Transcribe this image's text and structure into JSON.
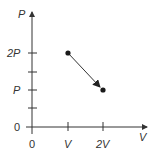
{
  "diagram": {
    "type": "pv-diagram",
    "axes": {
      "y_label": "P",
      "x_label": "V",
      "origin_label_y": "0",
      "origin_label_x": "0"
    },
    "y_ticks": [
      {
        "label": "2P",
        "value": 2
      },
      {
        "label": "",
        "value": 1.5
      },
      {
        "label": "P",
        "value": 1
      },
      {
        "label": "",
        "value": 0.5
      }
    ],
    "x_ticks": [
      {
        "label": "V",
        "value": 1
      },
      {
        "label": "2V",
        "value": 2
      }
    ],
    "process": {
      "start": {
        "V": "V",
        "P": "2P"
      },
      "end": {
        "V": "2V",
        "P": "P"
      },
      "direction": "start-to-end"
    },
    "colors": {
      "line": "#333333",
      "point": "#1a1a1a"
    }
  }
}
